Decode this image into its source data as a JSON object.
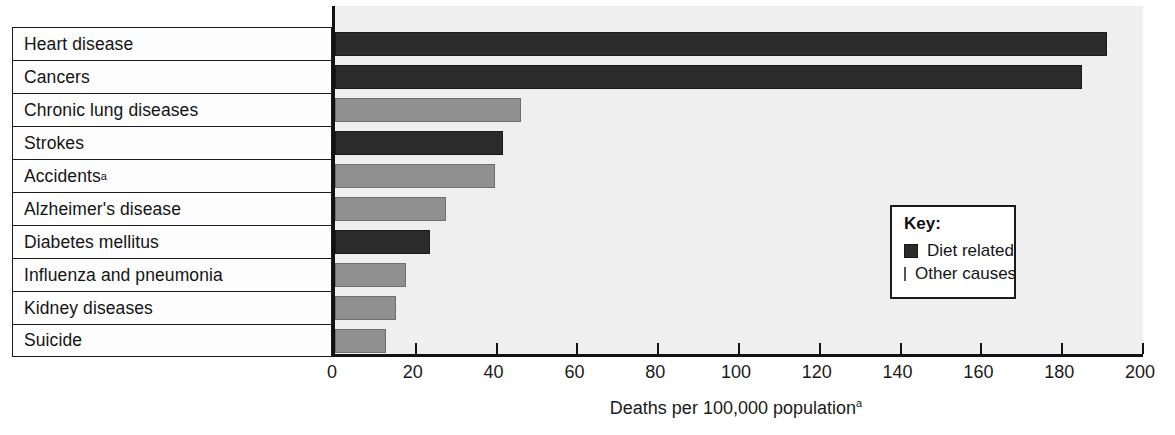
{
  "chart_data": {
    "type": "bar",
    "orientation": "horizontal",
    "title": "",
    "xlabel": "Deaths per 100,000 population",
    "xlabel_superscript": "a",
    "ylabel": "",
    "xlim": [
      0,
      200
    ],
    "xticks": [
      0,
      20,
      40,
      60,
      80,
      100,
      120,
      140,
      160,
      180,
      200
    ],
    "xtick_labels": [
      "0",
      "20",
      "40",
      "60",
      "80",
      "100",
      "120",
      "140",
      "160",
      "180",
      "200"
    ],
    "grid": false,
    "categories": [
      "Heart disease",
      "Cancers",
      "Chronic lung diseases",
      "Strokes",
      "Accidents",
      "Alzheimer's disease",
      "Diabetes mellitus",
      "Influenza and pneumonia",
      "Kidney diseases",
      "Suicide"
    ],
    "category_superscripts": [
      "",
      "",
      "",
      "",
      "a",
      "",
      "",
      "",
      "",
      ""
    ],
    "values": [
      191,
      185,
      46,
      41.5,
      39.5,
      27.5,
      23.5,
      17.5,
      15,
      12.5
    ],
    "groups": [
      "Diet related",
      "Diet related",
      "Other causes",
      "Diet related",
      "Other causes",
      "Other causes",
      "Diet related",
      "Other causes",
      "Other causes",
      "Other causes"
    ],
    "legend": {
      "title": "Key:",
      "position": "inside-right",
      "entries": [
        {
          "label": "Diet related",
          "color": "#2b2b2b"
        },
        {
          "label": "Other causes",
          "color": "#909090"
        }
      ]
    },
    "colors": {
      "diet_related": "#2b2b2b",
      "other_causes": "#909090",
      "plot_background": "#efefef",
      "axis": "#111111"
    }
  }
}
